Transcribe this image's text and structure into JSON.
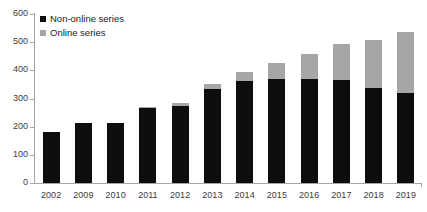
{
  "chart_data": {
    "type": "bar",
    "subtype": "stacked-vertical",
    "title": "",
    "subtitle": "",
    "xlabel": "",
    "ylabel": "",
    "categories": [
      "2002",
      "2009",
      "2010",
      "2011",
      "2012",
      "2013",
      "2014",
      "2015",
      "2016",
      "2017",
      "2018",
      "2019"
    ],
    "series": [
      {
        "name": "Non-online series",
        "color": "#0d0d0d",
        "values": [
          180,
          212,
          212,
          265,
          275,
          335,
          363,
          368,
          368,
          365,
          337,
          320
        ]
      },
      {
        "name": "Online series",
        "color": "#a6a6a6",
        "values": [
          0,
          0,
          0,
          5,
          10,
          15,
          30,
          57,
          90,
          127,
          170,
          215
        ]
      }
    ],
    "totals": [
      180,
      212,
      212,
      270,
      285,
      350,
      393,
      425,
      458,
      492,
      507,
      535
    ],
    "ylim": [
      0,
      600
    ],
    "yticks": [
      0,
      100,
      200,
      300,
      400,
      500,
      600
    ],
    "ytick_labels": [
      "0",
      "100",
      "200",
      "300",
      "400",
      "500",
      "600"
    ],
    "grid": false,
    "legend_position": "top-left",
    "legend": [
      "Non-online series",
      "Online series"
    ]
  },
  "axes": {
    "y_axis_name": "y-axis",
    "x_axis_name": "x-axis"
  },
  "colors": {
    "non_online": "#0d0d0d",
    "online": "#a6a6a6",
    "axis": "#a6a6a6",
    "text": "#3b3b3b",
    "background": "#ffffff"
  }
}
